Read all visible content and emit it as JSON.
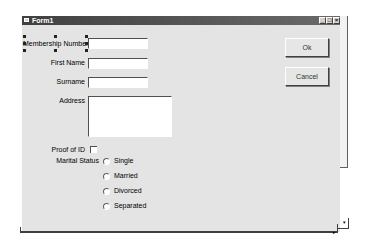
{
  "window": {
    "title": "Form1",
    "controls": {
      "minimize": "_",
      "maximize": "□",
      "close": "×"
    }
  },
  "form": {
    "fields": [
      {
        "label": "Membership Number",
        "access_key": "M",
        "value": "",
        "selected": true
      },
      {
        "label": "First Name",
        "access_key": "F",
        "value": ""
      },
      {
        "label": "Surname",
        "access_key": "S",
        "value": ""
      },
      {
        "label": "Address",
        "access_key": "A",
        "value": ""
      }
    ],
    "proof_of_id": {
      "label": "Proof of ID",
      "checked": false
    },
    "marital_status": {
      "label": "Marital Status",
      "options": [
        "Single",
        "Married",
        "Divorced",
        "Separated"
      ],
      "selected": null
    }
  },
  "buttons": {
    "ok": "Ok",
    "cancel": "Cancel"
  },
  "scrollbars": {
    "h_arrow_right": "▸",
    "v_arrow_down": "▾"
  },
  "colors": {
    "titlebar": "#404040",
    "form_bg": "#e4e4e4",
    "grid_dot": "#9a9a9a"
  }
}
